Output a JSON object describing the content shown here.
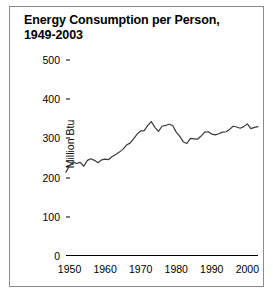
{
  "figure": {
    "title_line1": "Energy Consumption per Person,",
    "title_line2": "1949-2003",
    "border_color": "#8a8a8a",
    "line_color": "#3a3a3a",
    "background": "#ffffff"
  },
  "chart_data": {
    "type": "line",
    "title": "Energy Consumption per Person, 1949-2003",
    "xlabel": "",
    "ylabel": "Million Btu",
    "xlim": [
      1949,
      2003
    ],
    "ylim": [
      0,
      500
    ],
    "ytick_values": [
      0,
      100,
      200,
      300,
      400,
      500
    ],
    "ytick_labels": [
      "0",
      "100",
      "200",
      "300",
      "400",
      "500"
    ],
    "xtick_values": [
      1950,
      1960,
      1970,
      1980,
      1990,
      2000
    ],
    "xtick_labels": [
      "1950",
      "1960",
      "1970",
      "1980",
      "1990",
      "2000"
    ],
    "grid": false,
    "legend": "none",
    "series": [
      {
        "name": "Energy consumption per person",
        "units": "Million Btu",
        "x": [
          1949,
          1950,
          1951,
          1952,
          1953,
          1954,
          1955,
          1956,
          1957,
          1958,
          1959,
          1960,
          1961,
          1962,
          1963,
          1964,
          1965,
          1966,
          1967,
          1968,
          1969,
          1970,
          1971,
          1972,
          1973,
          1974,
          1975,
          1976,
          1977,
          1978,
          1979,
          1980,
          1981,
          1982,
          1983,
          1984,
          1985,
          1986,
          1987,
          1988,
          1989,
          1990,
          1991,
          1992,
          1993,
          1994,
          1995,
          1996,
          1997,
          1998,
          1999,
          2000,
          2001,
          2002,
          2003
        ],
        "y": [
          214,
          231,
          240,
          236,
          239,
          229,
          244,
          248,
          244,
          238,
          245,
          247,
          246,
          254,
          259,
          265,
          272,
          283,
          288,
          299,
          311,
          319,
          320,
          333,
          343,
          328,
          318,
          331,
          333,
          336,
          333,
          316,
          305,
          291,
          287,
          300,
          299,
          298,
          306,
          316,
          317,
          311,
          309,
          312,
          316,
          317,
          323,
          331,
          329,
          326,
          330,
          337,
          325,
          328,
          330
        ]
      }
    ]
  }
}
